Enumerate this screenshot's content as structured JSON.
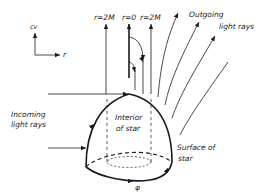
{
  "diagram": {
    "axes": {
      "vertical_label": "cv",
      "horizontal_label": "r"
    },
    "world_line_labels": {
      "left": "r=2M",
      "center": "r=0",
      "right": "r=2M"
    },
    "annotations": {
      "outgoing_line1": "Outgoing",
      "outgoing_line2": "light rays",
      "incoming_line1": "Incoming",
      "incoming_line2": "light rays",
      "interior_line1": "Interior",
      "interior_line2": "of star",
      "surface_line1": "Surface of",
      "surface_line2": "star",
      "angle": "φ"
    },
    "colors": {
      "ink": "#1a1a1a",
      "background": "#ffffff"
    }
  }
}
